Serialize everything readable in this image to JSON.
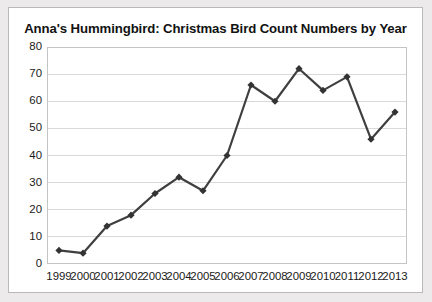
{
  "chart_data": {
    "type": "line",
    "title": "Anna's Hummingbird: Christmas Bird Count Numbers by Year",
    "xlabel": "",
    "ylabel": "",
    "categories": [
      "1999",
      "2000",
      "2001",
      "2002",
      "2003",
      "2004",
      "2005",
      "2006",
      "2007",
      "2008",
      "2009",
      "2010",
      "2011",
      "2012",
      "2013"
    ],
    "values": [
      5,
      4,
      14,
      18,
      26,
      32,
      27,
      40,
      66,
      60,
      72,
      64,
      69,
      46,
      56
    ],
    "series": [
      {
        "name": "Anna's Hummingbird count",
        "values": [
          5,
          4,
          14,
          18,
          26,
          32,
          27,
          40,
          66,
          60,
          72,
          64,
          69,
          46,
          56
        ]
      }
    ],
    "ylim": [
      0,
      80
    ],
    "yticks": [
      0,
      10,
      20,
      30,
      40,
      50,
      60,
      70,
      80
    ],
    "ytick_labels": [
      "0",
      "10",
      "20",
      "30",
      "40",
      "50",
      "60",
      "70",
      "80"
    ],
    "grid": "horizontal",
    "legend": "none",
    "marker": "diamond",
    "line_color": "#3f3f3f",
    "marker_color": "#333333",
    "grid_color": "#d9d9d9",
    "plot_border_color": "#c4c4c4",
    "background_color": "#ffffff",
    "page_background_color": "#eceaea",
    "title_color": "#121212"
  }
}
